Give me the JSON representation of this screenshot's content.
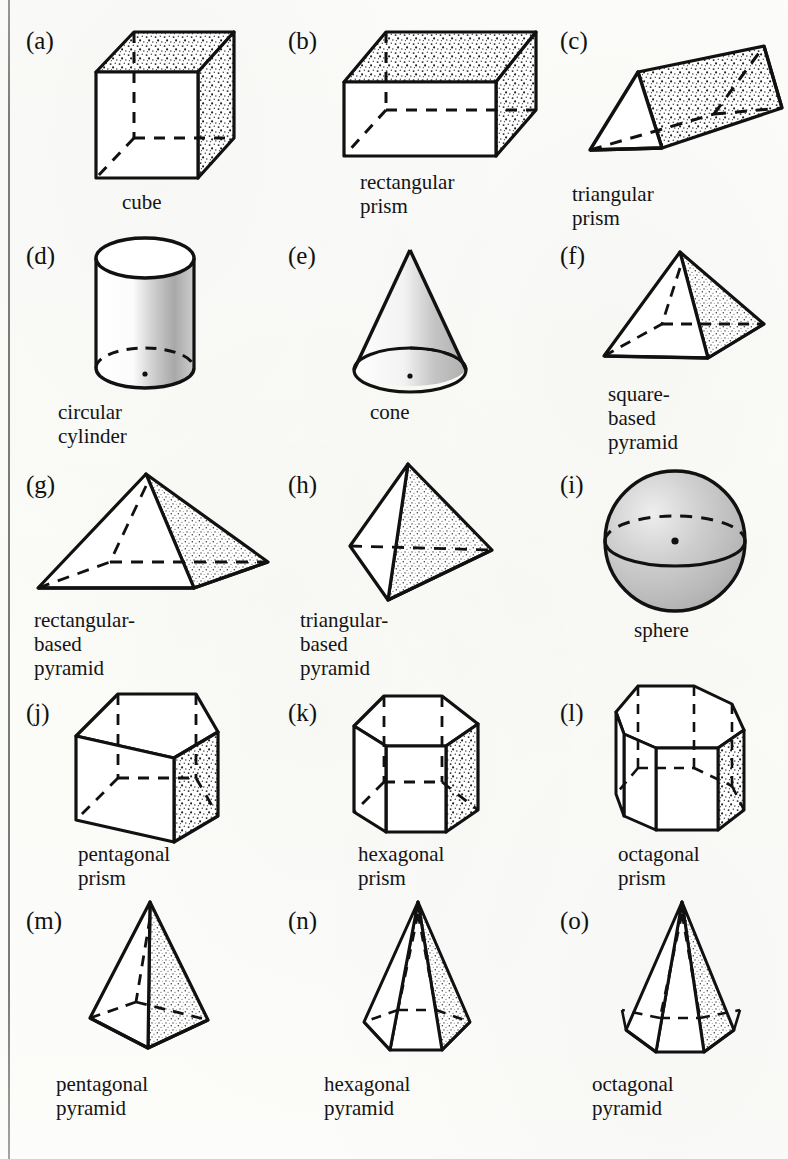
{
  "figure": {
    "border": {
      "left_rule_color": "#6d6d6d"
    },
    "colors": {
      "ink": "#111111",
      "stipple": "#2b2b2b",
      "shade_light": "#d8d8d8",
      "shade_mid": "#b5b5b5",
      "paper": "#fdfdfb"
    }
  },
  "items": [
    {
      "tag": "(a)",
      "label": "cube",
      "shape": "cube",
      "tag_x": 26,
      "tag_y": 28,
      "art_x": 82,
      "art_y": 26,
      "art_w": 160,
      "art_h": 158,
      "cap_x": 122,
      "cap_y": 190
    },
    {
      "tag": "(b)",
      "label": "rectangular\nprism",
      "shape": "rectangular-prism",
      "tag_x": 288,
      "tag_y": 28,
      "art_x": 340,
      "art_y": 24,
      "art_w": 220,
      "art_h": 140,
      "cap_x": 360,
      "cap_y": 170
    },
    {
      "tag": "(c)",
      "label": "triangular prism",
      "shape": "triangular-prism",
      "tag_x": 560,
      "tag_y": 28,
      "art_x": 586,
      "art_y": 40,
      "art_w": 196,
      "art_h": 130,
      "cap_x": 572,
      "cap_y": 182
    },
    {
      "tag": "(d)",
      "label": "circular cylinder",
      "shape": "cylinder",
      "tag_x": 26,
      "tag_y": 243,
      "art_x": 90,
      "art_y": 236,
      "art_w": 100,
      "art_h": 155,
      "cap_x": 58,
      "cap_y": 400
    },
    {
      "tag": "(e)",
      "label": "cone",
      "shape": "cone",
      "tag_x": 288,
      "tag_y": 243,
      "art_x": 340,
      "art_y": 246,
      "art_w": 130,
      "art_h": 146,
      "cap_x": 370,
      "cap_y": 400
    },
    {
      "tag": "(f)",
      "label": "square-based\npyramid",
      "shape": "square-pyramid",
      "tag_x": 560,
      "tag_y": 243,
      "art_x": 596,
      "art_y": 248,
      "art_w": 180,
      "art_h": 124,
      "cap_x": 608,
      "cap_y": 382
    },
    {
      "tag": "(g)",
      "label": "rectangular-based\npyramid",
      "shape": "rectangular-pyramid",
      "tag_x": 26,
      "tag_y": 472,
      "art_x": 30,
      "art_y": 470,
      "art_w": 244,
      "art_h": 124,
      "cap_x": 34,
      "cap_y": 608
    },
    {
      "tag": "(h)",
      "label": "triangular-based\npyramid",
      "shape": "tetrahedron",
      "tag_x": 288,
      "tag_y": 472,
      "art_x": 346,
      "art_y": 462,
      "art_w": 150,
      "art_h": 145,
      "cap_x": 300,
      "cap_y": 608
    },
    {
      "tag": "(i)",
      "label": "sphere",
      "shape": "sphere",
      "tag_x": 560,
      "tag_y": 472,
      "art_x": 600,
      "art_y": 466,
      "art_w": 148,
      "art_h": 148,
      "cap_x": 634,
      "cap_y": 618
    },
    {
      "tag": "(j)",
      "label": "pentagonal\nprism",
      "shape": "pentagonal-prism",
      "tag_x": 26,
      "tag_y": 700,
      "art_x": 70,
      "art_y": 690,
      "art_w": 146,
      "art_h": 150,
      "cap_x": 78,
      "cap_y": 842
    },
    {
      "tag": "(k)",
      "label": "hexagonal\nprism",
      "shape": "hexagonal-prism",
      "tag_x": 288,
      "tag_y": 700,
      "art_x": 350,
      "art_y": 690,
      "art_w": 128,
      "art_h": 150,
      "cap_x": 358,
      "cap_y": 842
    },
    {
      "tag": "(l)",
      "label": "octagonal\nprism",
      "shape": "octagonal-prism",
      "tag_x": 560,
      "tag_y": 700,
      "art_x": 610,
      "art_y": 682,
      "art_w": 130,
      "art_h": 158,
      "cap_x": 618,
      "cap_y": 842
    },
    {
      "tag": "(m)",
      "label": "pentagonal\npyramid",
      "shape": "pentagonal-pyramid",
      "tag_x": 26,
      "tag_y": 908,
      "art_x": 72,
      "art_y": 898,
      "art_w": 150,
      "art_h": 170,
      "cap_x": 56,
      "cap_y": 1072
    },
    {
      "tag": "(n)",
      "label": "hexagonal\npyramid",
      "shape": "hexagonal-pyramid",
      "tag_x": 288,
      "tag_y": 908,
      "art_x": 350,
      "art_y": 898,
      "art_w": 130,
      "art_h": 170,
      "cap_x": 324,
      "cap_y": 1072
    },
    {
      "tag": "(o)",
      "label": "octagonal\npyramid",
      "shape": "octagonal-pyramid",
      "tag_x": 560,
      "tag_y": 908,
      "art_x": 608,
      "art_y": 898,
      "art_w": 140,
      "art_h": 170,
      "cap_x": 592,
      "cap_y": 1072
    }
  ]
}
